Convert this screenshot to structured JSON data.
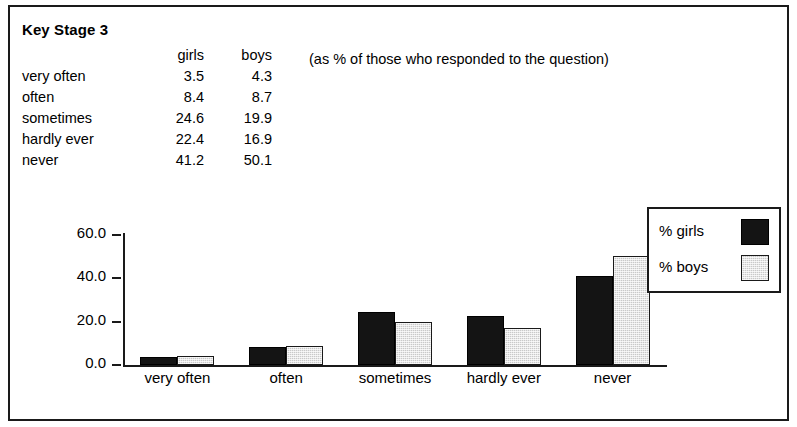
{
  "title": "Key Stage 3",
  "note": "(as % of those who responded to the question)",
  "table": {
    "headers": [
      "",
      "girls",
      "boys"
    ],
    "rows": [
      {
        "label": "very often",
        "girls": "3.5",
        "boys": "4.3"
      },
      {
        "label": "often",
        "girls": "8.4",
        "boys": "8.7"
      },
      {
        "label": "sometimes",
        "girls": "24.6",
        "boys": "19.9"
      },
      {
        "label": "hardly ever",
        "girls": "22.4",
        "boys": "16.9"
      },
      {
        "label": "never",
        "girls": "41.2",
        "boys": "50.1"
      }
    ]
  },
  "legend": {
    "items": [
      {
        "label": "% girls",
        "color": "#141414"
      },
      {
        "label": "% boys",
        "color": "#c9c9c9"
      }
    ]
  },
  "chart_data": {
    "type": "bar",
    "title": "Key Stage 3",
    "xlabel": "",
    "ylabel": "",
    "grid": false,
    "legend_position": "right",
    "categories": [
      "very often",
      "often",
      "sometimes",
      "hardly ever",
      "never"
    ],
    "series": [
      {
        "name": "% girls",
        "color": "#141414",
        "values": [
          3.5,
          8.4,
          24.6,
          22.4,
          41.2
        ]
      },
      {
        "name": "% boys",
        "color": "#c9c9c9",
        "values": [
          4.3,
          8.7,
          19.9,
          16.9,
          50.1
        ]
      }
    ],
    "ylim": [
      0,
      60
    ],
    "yticks": [
      "0.0",
      "20.0",
      "40.0",
      "60.0"
    ],
    "ytick_values": [
      0,
      20,
      40,
      60
    ]
  }
}
